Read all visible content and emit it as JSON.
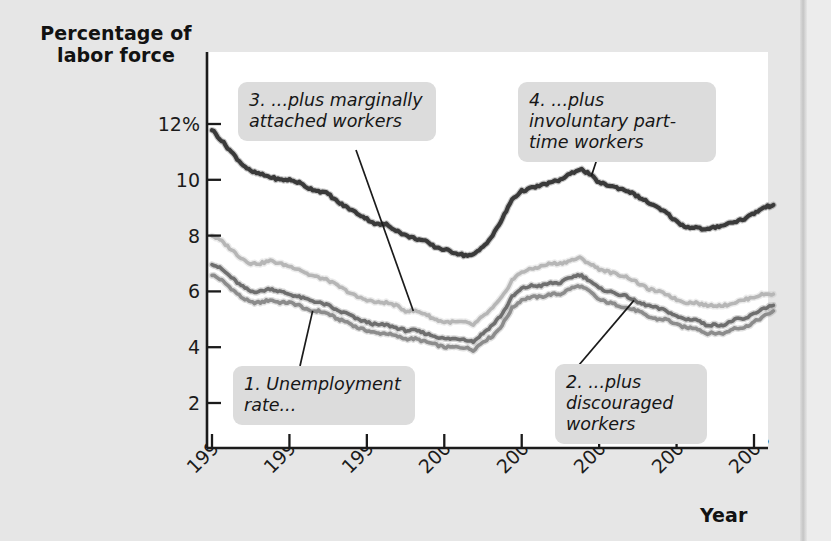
{
  "figure": {
    "y_axis_title": "Percentage of\nlabor force",
    "x_axis_title": "Year"
  },
  "callouts": [
    {
      "id": "callout-1",
      "text": "1. Unemployment rate..."
    },
    {
      "id": "callout-2",
      "text": "2. ...plus discouraged workers"
    },
    {
      "id": "callout-3",
      "text": "3. ...plus marginally attached workers"
    },
    {
      "id": "callout-4",
      "text": "4. ...plus involuntary part-time workers"
    }
  ],
  "colors": {
    "background": "#e6e6e6",
    "plot_background": "#ffffff",
    "axis": "#1b1b1b",
    "callout_background": "#dcdcdc",
    "series_1_unemployment": "#8c8c8c",
    "series_2_discouraged": "#6e6e6e",
    "series_3_marginally_attached": "#b6b6b6",
    "series_4_part_time": "#3a3a3a"
  },
  "chart_data": {
    "type": "line",
    "title": "",
    "subtitle": "",
    "xlabel": "Year",
    "ylabel": "Percentage of labor force",
    "xlim": [
      1994,
      2008.6
    ],
    "ylim": [
      0,
      12.8
    ],
    "grid": false,
    "legend_position": "annotations-inline",
    "xticks": [
      1994,
      1996,
      1998,
      2000,
      2002,
      2004,
      2006,
      2008
    ],
    "xtick_labels": [
      "1994",
      "1996",
      "1998",
      "2000",
      "2002",
      "2004",
      "2006",
      "2008"
    ],
    "yticks": [
      2,
      4,
      6,
      8,
      10,
      12
    ],
    "ytick_labels": [
      "2",
      "4",
      "6",
      "8",
      "10",
      "12%"
    ],
    "annotations": [
      {
        "label": "1. Unemployment rate...",
        "points_to_series": "Unemployment rate",
        "points_to_x": 1996.6
      },
      {
        "label": "2. ...plus discouraged workers",
        "points_to_series": "...plus discouraged workers",
        "points_to_x": 2004.9
      },
      {
        "label": "3. ...plus marginally attached workers",
        "points_to_series": "...plus marginally attached workers",
        "points_to_x": 1999.2
      },
      {
        "label": "4. ...plus involuntary part-time workers",
        "points_to_series": "...plus involuntary part-time workers",
        "points_to_x": 2003.8
      }
    ],
    "x": [
      1994.0,
      1994.25,
      1994.5,
      1994.75,
      1995.0,
      1995.25,
      1995.5,
      1995.75,
      1996.0,
      1996.25,
      1996.5,
      1996.75,
      1997.0,
      1997.25,
      1997.5,
      1997.75,
      1998.0,
      1998.25,
      1998.5,
      1998.75,
      1999.0,
      1999.25,
      1999.5,
      1999.75,
      2000.0,
      2000.25,
      2000.5,
      2000.75,
      2001.0,
      2001.25,
      2001.5,
      2001.75,
      2002.0,
      2002.25,
      2002.5,
      2002.75,
      2003.0,
      2003.25,
      2003.5,
      2003.75,
      2004.0,
      2004.25,
      2004.5,
      2004.75,
      2005.0,
      2005.25,
      2005.5,
      2005.75,
      2006.0,
      2006.25,
      2006.5,
      2006.75,
      2007.0,
      2007.25,
      2007.5,
      2007.75,
      2008.0,
      2008.25,
      2008.5
    ],
    "series": [
      {
        "name": "Unemployment rate",
        "color": "#8c8c8c",
        "values": [
          6.6,
          6.4,
          6.1,
          5.8,
          5.6,
          5.6,
          5.7,
          5.6,
          5.6,
          5.5,
          5.3,
          5.3,
          5.2,
          5.0,
          4.9,
          4.7,
          4.6,
          4.5,
          4.5,
          4.4,
          4.3,
          4.3,
          4.2,
          4.1,
          4.0,
          4.0,
          4.0,
          3.9,
          4.2,
          4.4,
          4.8,
          5.4,
          5.7,
          5.8,
          5.8,
          5.9,
          5.9,
          6.1,
          6.2,
          6.0,
          5.7,
          5.6,
          5.5,
          5.4,
          5.3,
          5.1,
          5.0,
          5.0,
          4.8,
          4.7,
          4.7,
          4.5,
          4.5,
          4.5,
          4.7,
          4.7,
          4.9,
          5.1,
          5.3
        ]
      },
      {
        "name": "...plus discouraged workers",
        "color": "#6e6e6e",
        "values": [
          7.0,
          6.8,
          6.5,
          6.2,
          6.0,
          6.0,
          6.1,
          6.0,
          5.9,
          5.8,
          5.7,
          5.6,
          5.5,
          5.3,
          5.2,
          5.0,
          4.9,
          4.8,
          4.8,
          4.7,
          4.6,
          4.6,
          4.5,
          4.4,
          4.3,
          4.3,
          4.3,
          4.2,
          4.5,
          4.8,
          5.2,
          5.8,
          6.1,
          6.2,
          6.2,
          6.3,
          6.3,
          6.5,
          6.6,
          6.4,
          6.1,
          6.0,
          5.9,
          5.8,
          5.6,
          5.5,
          5.4,
          5.3,
          5.1,
          5.0,
          5.0,
          4.8,
          4.8,
          4.8,
          5.0,
          5.0,
          5.2,
          5.4,
          5.5
        ]
      },
      {
        "name": "...plus marginally attached workers",
        "color": "#b6b6b6",
        "values": [
          8.0,
          7.8,
          7.5,
          7.2,
          7.0,
          7.0,
          7.1,
          7.0,
          6.9,
          6.8,
          6.6,
          6.5,
          6.4,
          6.2,
          6.0,
          5.8,
          5.7,
          5.6,
          5.6,
          5.5,
          5.3,
          5.3,
          5.2,
          5.0,
          4.9,
          4.9,
          4.9,
          4.8,
          5.1,
          5.4,
          5.8,
          6.4,
          6.7,
          6.8,
          6.9,
          7.0,
          7.0,
          7.1,
          7.2,
          7.0,
          6.8,
          6.7,
          6.6,
          6.5,
          6.3,
          6.1,
          6.0,
          5.9,
          5.7,
          5.6,
          5.6,
          5.5,
          5.5,
          5.5,
          5.6,
          5.7,
          5.8,
          5.9,
          5.9
        ]
      },
      {
        "name": "...plus involuntary part-time workers",
        "color": "#3a3a3a",
        "values": [
          11.8,
          11.4,
          11.0,
          10.6,
          10.3,
          10.2,
          10.1,
          10.0,
          10.0,
          9.9,
          9.7,
          9.6,
          9.5,
          9.2,
          9.0,
          8.8,
          8.6,
          8.4,
          8.4,
          8.2,
          8.0,
          7.9,
          7.8,
          7.6,
          7.5,
          7.4,
          7.3,
          7.3,
          7.6,
          8.0,
          8.6,
          9.3,
          9.6,
          9.7,
          9.8,
          9.9,
          10.0,
          10.2,
          10.4,
          10.2,
          9.9,
          9.8,
          9.7,
          9.6,
          9.4,
          9.2,
          9.0,
          8.8,
          8.5,
          8.3,
          8.3,
          8.2,
          8.3,
          8.4,
          8.5,
          8.6,
          8.8,
          9.0,
          9.1
        ]
      }
    ]
  }
}
